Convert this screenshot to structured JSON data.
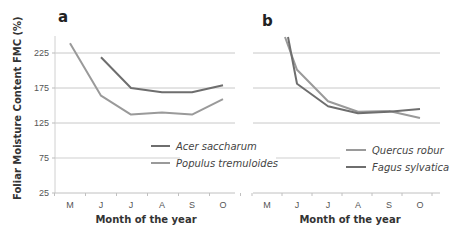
{
  "chart_data": [
    {
      "type": "line",
      "panel_label": "a",
      "title": "",
      "xlabel": "Month of the year",
      "ylabel": "Foliar Moisture Content FMC  (%)",
      "categories": [
        "M",
        "J",
        "J",
        "A",
        "S",
        "O"
      ],
      "yticks": [
        25,
        75,
        125,
        175,
        225
      ],
      "ylim": [
        25,
        250
      ],
      "grid": true,
      "legend_position": "center-right",
      "series": [
        {
          "name": "Acer saccharum",
          "color": "#6e6e6e",
          "values": [
            null,
            219,
            175,
            169,
            169,
            179
          ]
        },
        {
          "name": "Populus tremuloides",
          "color": "#9a9a9a",
          "values": [
            239,
            164,
            137,
            140,
            137,
            159
          ]
        }
      ]
    },
    {
      "type": "line",
      "panel_label": "b",
      "title": "",
      "xlabel": "Month of the year",
      "ylabel": "",
      "categories": [
        "M",
        "J",
        "J",
        "A",
        "S",
        "O"
      ],
      "yticks": [
        25,
        75,
        125,
        175,
        225
      ],
      "ylim": [
        25,
        250
      ],
      "grid": true,
      "legend_position": "center-right",
      "series": [
        {
          "name": "Quercus robur",
          "color": "#9a9a9a",
          "values": [
            248,
            201,
            156,
            141,
            142,
            132
          ]
        },
        {
          "name": "Fagus sylvatica",
          "color": "#6e6e6e",
          "values": [
            248,
            181,
            149,
            139,
            141,
            145
          ]
        }
      ]
    }
  ]
}
